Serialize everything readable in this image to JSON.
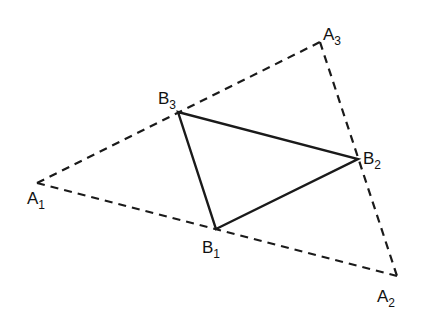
{
  "diagram": {
    "type": "geometry",
    "points": {
      "A1": {
        "x": 37,
        "y": 183,
        "label": "A",
        "sub": "1"
      },
      "A2": {
        "x": 397,
        "y": 276,
        "label": "A",
        "sub": "2"
      },
      "A3": {
        "x": 320,
        "y": 42,
        "label": "A",
        "sub": "3"
      },
      "B1": {
        "x": 216,
        "y": 229,
        "label": "B",
        "sub": "1"
      },
      "B2": {
        "x": 358,
        "y": 159,
        "label": "B",
        "sub": "2"
      },
      "B3": {
        "x": 178,
        "y": 112,
        "label": "B",
        "sub": "3"
      }
    },
    "outer_triangle": {
      "style": "dashed",
      "vertices": [
        "A1",
        "A2",
        "A3"
      ]
    },
    "inner_triangle": {
      "style": "solid",
      "vertices": [
        "B1",
        "B2",
        "B3"
      ]
    },
    "colors": {
      "stroke": "#1a1a1a",
      "background": "#ffffff"
    }
  }
}
